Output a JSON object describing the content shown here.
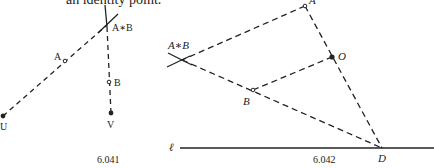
{
  "top_text_fragment": "an identity point.",
  "figures": [
    {
      "id": "fig-6041",
      "caption": "6.041",
      "labels": {
        "A": "A",
        "B": "B",
        "AB": "A∗B",
        "U": "U",
        "V": "V"
      },
      "points": {
        "U": {
          "x": 3,
          "y": 116,
          "style": "filled"
        },
        "A": {
          "x": 65,
          "y": 61,
          "style": "open"
        },
        "AB": {
          "x": 107,
          "y": 25,
          "style": "intersection"
        },
        "B": {
          "x": 109,
          "y": 82,
          "style": "open"
        },
        "V": {
          "x": 111,
          "y": 113,
          "style": "filled"
        }
      },
      "lines": [
        {
          "from": "U",
          "to": "AB",
          "style": "dashed"
        },
        {
          "from": "AB",
          "to": "V",
          "style": "dashed"
        }
      ]
    },
    {
      "id": "fig-6042",
      "caption": "6.042",
      "labels": {
        "A": "A",
        "B": "B",
        "O": "O",
        "D": "D",
        "AB": "A∗B",
        "ell": "ℓ"
      },
      "points": {
        "A": {
          "x": 305,
          "y": 6,
          "style": "open"
        },
        "O": {
          "x": 332,
          "y": 57,
          "style": "filled"
        },
        "B": {
          "x": 253,
          "y": 90,
          "style": "open"
        },
        "D": {
          "x": 382,
          "y": 148,
          "style": "plain"
        },
        "AB": {
          "x": 182,
          "y": 60,
          "style": "intersection"
        }
      },
      "lines": [
        {
          "from": "A",
          "to": "AB",
          "style": "dashed"
        },
        {
          "from": "AB",
          "to": "D",
          "style": "dashed",
          "through": "B"
        },
        {
          "from": "A",
          "to": "D",
          "style": "dashed",
          "through": "O"
        },
        {
          "from": "B",
          "to": "O",
          "style": "dashed"
        },
        {
          "name": "ell",
          "from_x": 180,
          "to_x": 434,
          "y": 148,
          "style": "solid"
        }
      ]
    }
  ]
}
